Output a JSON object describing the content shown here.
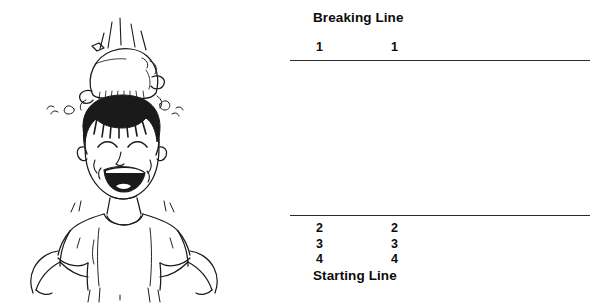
{
  "page": {
    "background_color": "#ffffff",
    "width": 606,
    "height": 306
  },
  "illustration": {
    "name": "laughing-child-balancing-beanbag",
    "description": "Black-and-white line drawing of a laughing child with closed curving eyes and an open smiling mouth, wearing a short-sleeved t-shirt with hands on hips, balancing a tied cloth beanbag on top of the head with motion marks around it.",
    "ink_color": "#1a1a1a"
  },
  "diagram": {
    "breaking_line_label": "Breaking Line",
    "starting_line_label": "Starting Line",
    "line_color": "#2a2a2a",
    "text_color": "#0b0b0b",
    "above_breaking_line": {
      "left_column": "1",
      "right_column": "1"
    },
    "above_starting_line_rows": [
      {
        "left_column": "2",
        "right_column": "2"
      },
      {
        "left_column": "3",
        "right_column": "3"
      },
      {
        "left_column": "4",
        "right_column": "4"
      }
    ]
  }
}
